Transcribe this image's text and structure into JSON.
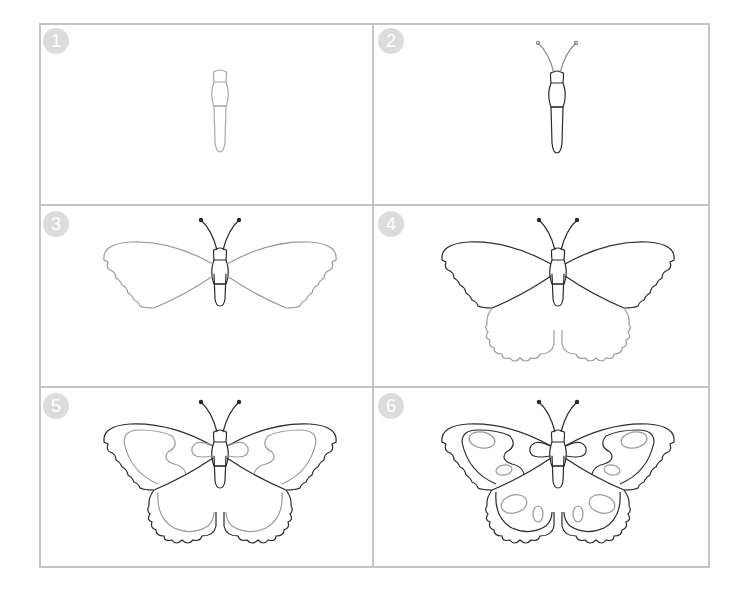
{
  "colors": {
    "grid_border": "#c4c4c4",
    "badge_bg": "#dcdcdc",
    "badge_text": "#ffffff",
    "ink_new": "#8a8a8a",
    "ink_done": "#2a2a2a",
    "background": "#ffffff"
  },
  "steps": [
    {
      "number": "1",
      "description": "Draw the head, thorax and abdomen"
    },
    {
      "number": "2",
      "description": "Add the antennae"
    },
    {
      "number": "3",
      "description": "Draw the front wings with a scalloped outer edge"
    },
    {
      "number": "4",
      "description": "Draw the hind wings"
    },
    {
      "number": "5",
      "description": "Add the wing pattern bands"
    },
    {
      "number": "6",
      "description": "Add oval spots on the wings"
    }
  ]
}
